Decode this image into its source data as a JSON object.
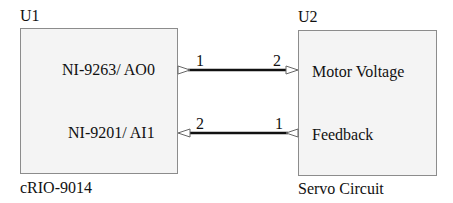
{
  "components": [
    {
      "ref": "U1",
      "name": "cRIO-9014",
      "ports": [
        {
          "label": "NI-9263/ AO0",
          "direction": "output"
        },
        {
          "label": "NI-9201/ AI1",
          "direction": "input"
        }
      ]
    },
    {
      "ref": "U2",
      "name": "Servo Circuit",
      "ports": [
        {
          "label": "Motor Voltage",
          "direction": "input"
        },
        {
          "label": "Feedback",
          "direction": "output"
        }
      ]
    }
  ],
  "connections": [
    {
      "from": "U1.NI-9263/ AO0",
      "to": "U2.Motor Voltage",
      "pin_from": "1",
      "pin_to": "2"
    },
    {
      "from": "U2.Feedback",
      "to": "U1.NI-9201/ AI1",
      "pin_from": "1",
      "pin_to": "2"
    }
  ],
  "colors": {
    "box_fill": "#f4f4f4",
    "box_border": "#8c8c8c",
    "wire": "#111111"
  }
}
